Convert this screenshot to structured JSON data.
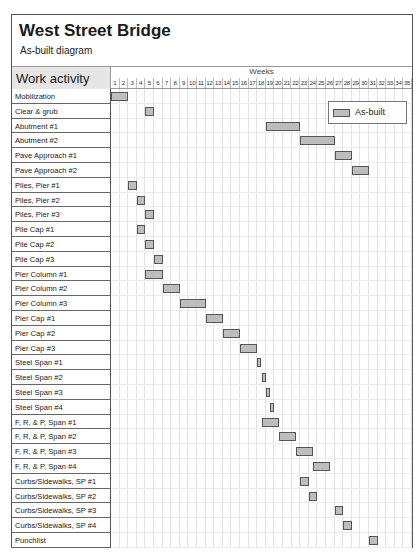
{
  "chart_data": {
    "type": "gantt",
    "title": "West Street Bridge",
    "subtitle": "As-built diagram",
    "row_header": "Work activity",
    "xlabel": "Weeks",
    "weeks": [
      1,
      2,
      3,
      4,
      5,
      6,
      7,
      8,
      9,
      10,
      11,
      12,
      13,
      14,
      15,
      16,
      17,
      18,
      19,
      20,
      21,
      22,
      23,
      24,
      25,
      26,
      27,
      28,
      29,
      30,
      31,
      32,
      33,
      34,
      35
    ],
    "legend": [
      {
        "label": "As-built",
        "color": "#bdbdbd"
      }
    ],
    "tasks": [
      {
        "name": "Mobilization",
        "start": 1,
        "end": 2
      },
      {
        "name": "Clear & grub",
        "start": 5,
        "end": 5
      },
      {
        "name": "Abutment #1",
        "start": 19,
        "end": 22
      },
      {
        "name": "Abutment #2",
        "start": 23,
        "end": 26
      },
      {
        "name": "Pave Approach #1",
        "start": 27,
        "end": 28
      },
      {
        "name": "Pave Approach #2",
        "start": 29,
        "end": 30
      },
      {
        "name": "Piles, Pier #1",
        "start": 3,
        "end": 3
      },
      {
        "name": "Piles, Pier #2",
        "start": 4,
        "end": 4
      },
      {
        "name": "Piles, Pier #3",
        "start": 5,
        "end": 5
      },
      {
        "name": "Pile Cap #1",
        "start": 4,
        "end": 4
      },
      {
        "name": "Pile Cap #2",
        "start": 5,
        "end": 5
      },
      {
        "name": "Pile Cap #3",
        "start": 6,
        "end": 6
      },
      {
        "name": "Pier Column #1",
        "start": 5,
        "end": 6
      },
      {
        "name": "Pier Column #2",
        "start": 7,
        "end": 8
      },
      {
        "name": "Pier Column #3",
        "start": 9,
        "end": 11
      },
      {
        "name": "Pier Cap #1",
        "start": 12,
        "end": 13
      },
      {
        "name": "Pier Cap #2",
        "start": 14,
        "end": 15
      },
      {
        "name": "Pier Cap #3",
        "start": 16,
        "end": 17
      },
      {
        "name": "Steel Span #1",
        "start": 18,
        "end": 18.5
      },
      {
        "name": "Steel Span #2",
        "start": 18.5,
        "end": 19
      },
      {
        "name": "Steel Span #3",
        "start": 19,
        "end": 19.5
      },
      {
        "name": "Steel Span #4",
        "start": 19.5,
        "end": 20
      },
      {
        "name": "F, R, & P, Span #1",
        "start": 18.5,
        "end": 20.5
      },
      {
        "name": "F, R, & P, Span #2",
        "start": 20.5,
        "end": 22.5
      },
      {
        "name": "F, R, & P, Span #3",
        "start": 22.5,
        "end": 24.5
      },
      {
        "name": "F, R, & P, Span #4",
        "start": 24.5,
        "end": 26.5
      },
      {
        "name": "Curbs/Sidewalks, SP #1",
        "start": 23,
        "end": 23
      },
      {
        "name": "Curbs/Sidewalks, SP #2",
        "start": 24,
        "end": 24
      },
      {
        "name": "Curbs/Sidewalks, SP #3",
        "start": 27,
        "end": 27
      },
      {
        "name": "Curbs/Sidewalks, SP #4",
        "start": 28,
        "end": 28
      },
      {
        "name": "Punchlist",
        "start": 31,
        "end": 31
      }
    ]
  }
}
